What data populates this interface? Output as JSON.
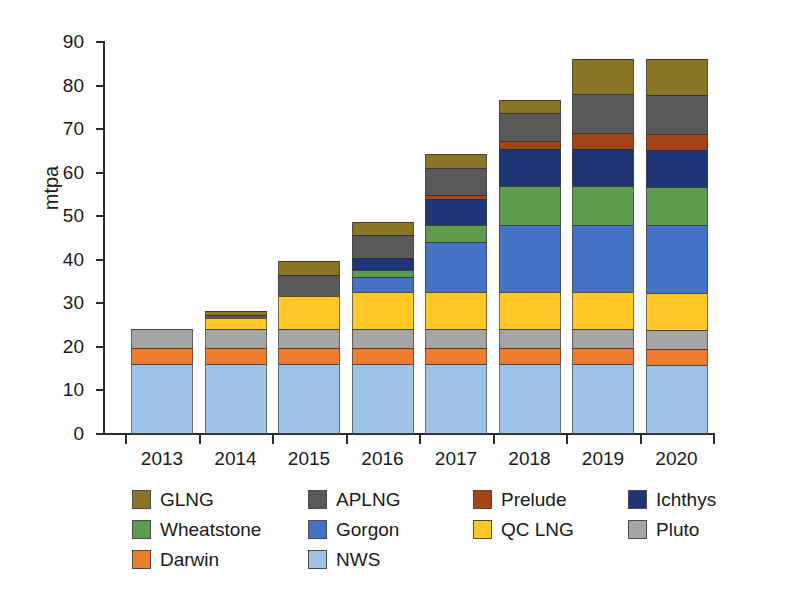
{
  "chart_data": {
    "type": "bar",
    "stacked": true,
    "title": "",
    "xlabel": "",
    "ylabel": "mtpa",
    "ylim": [
      0,
      90
    ],
    "yticks": [
      0,
      10,
      20,
      30,
      40,
      50,
      60,
      70,
      80,
      90
    ],
    "grid": false,
    "legend_position": "bottom",
    "categories": [
      "2013",
      "2014",
      "2015",
      "2016",
      "2017",
      "2018",
      "2019",
      "2020"
    ],
    "stack_order_bottom_to_top": [
      "NWS",
      "Darwin",
      "Pluto",
      "QC LNG",
      "Gorgon",
      "Wheatstone",
      "Ichthys",
      "Prelude",
      "APLNG",
      "GLNG"
    ],
    "series": [
      {
        "name": "NWS",
        "color": "#9DC3E6",
        "values": [
          16.0,
          16.0,
          16.0,
          16.0,
          16.0,
          16.0,
          16.0,
          15.8
        ]
      },
      {
        "name": "Darwin",
        "color": "#ED7D31",
        "values": [
          3.7,
          3.7,
          3.7,
          3.7,
          3.7,
          3.7,
          3.7,
          3.7
        ]
      },
      {
        "name": "Pluto",
        "color": "#A5A5A5",
        "values": [
          4.3,
          4.3,
          4.3,
          4.3,
          4.3,
          4.3,
          4.3,
          4.3
        ]
      },
      {
        "name": "QC LNG",
        "color": "#FFC727",
        "values": [
          0.0,
          2.6,
          7.8,
          8.5,
          8.5,
          8.5,
          8.5,
          8.5
        ]
      },
      {
        "name": "Gorgon",
        "color": "#4472C4",
        "values": [
          0.0,
          0.0,
          0.0,
          3.5,
          11.5,
          15.6,
          15.6,
          15.6
        ]
      },
      {
        "name": "Wheatstone",
        "color": "#5E9B4E",
        "values": [
          0.0,
          0.0,
          0.0,
          1.7,
          4.0,
          8.9,
          8.9,
          8.9
        ]
      },
      {
        "name": "Ichthys",
        "color": "#1F3575",
        "values": [
          0.0,
          0.0,
          0.0,
          2.6,
          6.0,
          8.4,
          8.4,
          8.4
        ]
      },
      {
        "name": "Prelude",
        "color": "#A3441A",
        "values": [
          0.0,
          0.0,
          0.0,
          0.0,
          0.8,
          1.9,
          3.6,
          3.6
        ]
      },
      {
        "name": "APLNG",
        "color": "#595959",
        "values": [
          0.0,
          0.8,
          4.6,
          5.3,
          6.3,
          6.3,
          9.0,
          9.0
        ]
      },
      {
        "name": "GLNG",
        "color": "#8A7425",
        "values": [
          0.0,
          0.9,
          3.4,
          3.0,
          3.2,
          3.2,
          8.0,
          8.2
        ]
      }
    ],
    "totals": [
      24.0,
      24.0,
      29.3,
      48.6,
      64.3,
      76.5,
      86.0,
      86.0
    ]
  },
  "axes": {
    "y_title": "mtpa",
    "y_tick_labels": [
      "90",
      "80",
      "70",
      "60",
      "50",
      "40",
      "30",
      "20",
      "10",
      "0"
    ],
    "x_tick_labels": [
      "2013",
      "2014",
      "2015",
      "2016",
      "2017",
      "2018",
      "2019",
      "2020"
    ]
  },
  "legend": {
    "items": [
      {
        "label": "GLNG",
        "color": "#8A7425"
      },
      {
        "label": "APLNG",
        "color": "#595959"
      },
      {
        "label": "Prelude",
        "color": "#A3441A"
      },
      {
        "label": "Ichthys",
        "color": "#1F3575"
      },
      {
        "label": "Wheatstone",
        "color": "#5E9B4E"
      },
      {
        "label": "Gorgon",
        "color": "#4472C4"
      },
      {
        "label": "QC LNG",
        "color": "#FFC727"
      },
      {
        "label": "Pluto",
        "color": "#A5A5A5"
      },
      {
        "label": "Darwin",
        "color": "#ED7D31"
      },
      {
        "label": "NWS",
        "color": "#9DC3E6"
      }
    ]
  },
  "colors": {
    "axis": "#2b2b2b",
    "text": "#1a1a1a",
    "background": "#ffffff"
  }
}
